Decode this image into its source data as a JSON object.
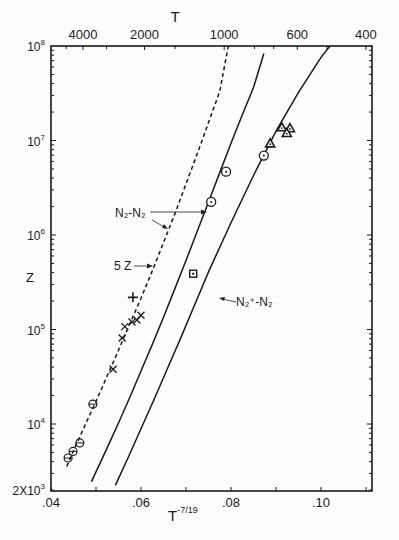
{
  "chart_data": {
    "type": "scatter",
    "title": "",
    "xlabel": "T^-7/19",
    "ylabel": "Z",
    "top_axis_label": "T",
    "xlim": [
      0.04,
      0.1113
    ],
    "ylim": [
      2000,
      100000000
    ],
    "yscale": "log",
    "grid": false,
    "x_ticks": [
      {
        "value": 0.04,
        "label": ".04"
      },
      {
        "value": 0.06,
        "label": ".06"
      },
      {
        "value": 0.08,
        "label": ".08"
      },
      {
        "value": 0.1,
        "label": ".10"
      }
    ],
    "x_minor_ticks": [
      0.05,
      0.07,
      0.09,
      0.11
    ],
    "y_ticks": [
      {
        "log": 8,
        "label": "10",
        "exp": "8"
      },
      {
        "log": 7,
        "label": "10",
        "exp": "7"
      },
      {
        "log": 6,
        "label": "10",
        "exp": "6"
      },
      {
        "log": 5,
        "label": "10",
        "exp": "5"
      },
      {
        "log": 4,
        "label": "10",
        "exp": "4"
      },
      {
        "log": 3.301,
        "label": "2X10",
        "exp": "3"
      }
    ],
    "top_ticks": [
      {
        "T": 4000,
        "label": "4000"
      },
      {
        "T": 2000,
        "label": "2000"
      },
      {
        "T": 1000,
        "label": "1000"
      },
      {
        "T": 600,
        "label": "600"
      },
      {
        "T": 400,
        "label": "400"
      }
    ],
    "top_minor_ticks": [
      5000,
      3000,
      1500,
      800,
      700,
      500
    ],
    "curves": [
      {
        "name": "5Z (N2-N2, scaled)",
        "style": "dashed",
        "points": [
          [
            0.0435,
            3.55
          ],
          [
            0.045,
            3.72
          ],
          [
            0.0475,
            3.98
          ],
          [
            0.05,
            4.24
          ],
          [
            0.0525,
            4.51
          ],
          [
            0.055,
            4.78
          ],
          [
            0.0575,
            5.06
          ],
          [
            0.06,
            5.33
          ],
          [
            0.0625,
            5.62
          ],
          [
            0.065,
            5.92
          ],
          [
            0.0675,
            6.22
          ],
          [
            0.07,
            6.54
          ],
          [
            0.0725,
            6.86
          ],
          [
            0.075,
            7.19
          ],
          [
            0.0775,
            7.52
          ],
          [
            0.0794,
            8.0
          ]
        ]
      },
      {
        "name": "N2-N2",
        "style": "solid",
        "points": [
          [
            0.049,
            3.39
          ],
          [
            0.0525,
            3.75
          ],
          [
            0.055,
            4.01
          ],
          [
            0.0575,
            4.28
          ],
          [
            0.06,
            4.56
          ],
          [
            0.0625,
            4.84
          ],
          [
            0.065,
            5.13
          ],
          [
            0.0675,
            5.43
          ],
          [
            0.07,
            5.73
          ],
          [
            0.0725,
            6.04
          ],
          [
            0.075,
            6.35
          ],
          [
            0.0775,
            6.66
          ],
          [
            0.08,
            6.97
          ],
          [
            0.0825,
            7.27
          ],
          [
            0.085,
            7.56
          ],
          [
            0.0873,
            7.92
          ]
        ]
      },
      {
        "name": "N2+-N2",
        "style": "solid",
        "points": [
          [
            0.0543,
            3.35
          ],
          [
            0.057,
            3.63
          ],
          [
            0.06,
            3.95
          ],
          [
            0.063,
            4.27
          ],
          [
            0.066,
            4.6
          ],
          [
            0.069,
            4.93
          ],
          [
            0.072,
            5.27
          ],
          [
            0.075,
            5.61
          ],
          [
            0.08,
            6.13
          ],
          [
            0.085,
            6.63
          ],
          [
            0.09,
            7.1
          ],
          [
            0.095,
            7.51
          ],
          [
            0.1,
            7.88
          ],
          [
            0.105,
            8.18
          ],
          [
            0.1113,
            8.51
          ]
        ]
      }
    ],
    "series": [
      {
        "name": "circle-bar",
        "marker": "theta",
        "points": [
          [
            0.0438,
            3.64
          ],
          [
            0.0449,
            3.71
          ],
          [
            0.0464,
            3.8
          ],
          [
            0.0493,
            4.21
          ]
        ]
      },
      {
        "name": "cross",
        "marker": "x",
        "points": [
          [
            0.0538,
            4.58
          ],
          [
            0.0558,
            4.91
          ],
          [
            0.0564,
            5.03
          ],
          [
            0.058,
            5.08
          ],
          [
            0.0591,
            5.1
          ],
          [
            0.06,
            5.15
          ]
        ]
      },
      {
        "name": "plus",
        "marker": "plus",
        "points": [
          [
            0.0582,
            5.34
          ]
        ]
      },
      {
        "name": "circle-dot",
        "marker": "circle-dot",
        "points": [
          [
            0.0756,
            6.35
          ],
          [
            0.0789,
            6.67
          ],
          [
            0.0873,
            6.84
          ]
        ]
      },
      {
        "name": "triangle",
        "marker": "triangle",
        "points": [
          [
            0.0887,
            6.97
          ],
          [
            0.0913,
            7.14
          ],
          [
            0.0931,
            7.13
          ],
          [
            0.0924,
            7.08
          ]
        ]
      },
      {
        "name": "square",
        "marker": "square-dot",
        "points": [
          [
            0.0716,
            5.59
          ]
        ]
      }
    ],
    "annotations": [
      {
        "text": "N2-N2",
        "main": "N",
        "sub1": "2",
        "dash": "-",
        "main2": "N",
        "sub2": "2"
      },
      {
        "text": "5 Z",
        "label": "5 Z"
      },
      {
        "text": "N2+-N2",
        "main": "N",
        "sup": "+",
        "sub1": "2",
        "dash": "-",
        "main2": "N",
        "sub2": "2"
      }
    ]
  },
  "labels": {
    "top_axis": "T",
    "y_axis": "Z",
    "x_axis_base": "T",
    "x_axis_exp": "-7/19",
    "ann_nn": "N₂-N₂",
    "ann_5z": "5 Z",
    "ann_np": "N₂⁺-N₂"
  }
}
